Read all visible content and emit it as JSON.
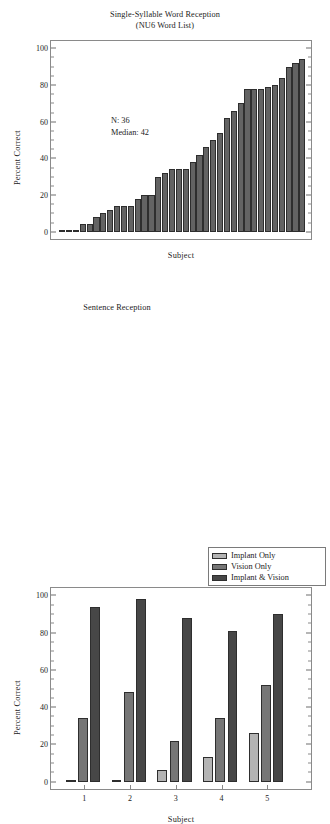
{
  "chart_data": [
    {
      "id": "word-reception",
      "type": "bar",
      "title": "Single-Syllable Word Reception",
      "subtitle": "(NU6 Word List)",
      "xlabel": "Subject",
      "ylabel": "Percent Correct",
      "ylim": [
        -4,
        104
      ],
      "yticks": [
        0,
        20,
        40,
        60,
        80,
        100
      ],
      "ytick_labels": [
        "0",
        "20",
        "40",
        "60",
        "80",
        "100"
      ],
      "yminor_step": 5,
      "grid": false,
      "legend": null,
      "annotations": [
        "N: 36",
        "Median: 42"
      ],
      "bar_color": "#636363",
      "bar_edge_color": "#2e2e2e",
      "categories": [
        "1",
        "2",
        "3",
        "4",
        "5",
        "6",
        "7",
        "8",
        "9",
        "10",
        "11",
        "12",
        "13",
        "14",
        "15",
        "16",
        "17",
        "18",
        "19",
        "20",
        "21",
        "22",
        "23",
        "24",
        "25",
        "26",
        "27",
        "28",
        "29",
        "30",
        "31",
        "32",
        "33",
        "34",
        "35",
        "36"
      ],
      "values": [
        0,
        0,
        0,
        4,
        4,
        8,
        10,
        12,
        14,
        14,
        14,
        18,
        20,
        20,
        30,
        32,
        34,
        34,
        34,
        38,
        42,
        46,
        50,
        54,
        62,
        66,
        70,
        78,
        78,
        78,
        79,
        80,
        84,
        90,
        92,
        94
      ]
    },
    {
      "id": "sentence-reception",
      "type": "bar",
      "title": "Sentence Reception",
      "subtitle": "",
      "xlabel": "Subject",
      "ylabel": "Percent Correct",
      "ylim": [
        -4,
        104
      ],
      "yticks": [
        0,
        20,
        40,
        60,
        80,
        100
      ],
      "ytick_labels": [
        "0",
        "20",
        "40",
        "60",
        "80",
        "100"
      ],
      "yminor_step": 5,
      "grid": false,
      "legend_position": "top-right-outside",
      "categories": [
        "1",
        "2",
        "3",
        "4",
        "5"
      ],
      "series": [
        {
          "name": "Implant Only",
          "color": "#b4b4b4",
          "values": [
            0,
            0,
            6,
            13,
            26
          ]
        },
        {
          "name": "Vision Only",
          "color": "#767676",
          "values": [
            34,
            48,
            22,
            34,
            52
          ]
        },
        {
          "name": "Implant & Vision",
          "color": "#474747",
          "values": [
            94,
            98,
            88,
            81,
            90
          ]
        }
      ]
    }
  ]
}
